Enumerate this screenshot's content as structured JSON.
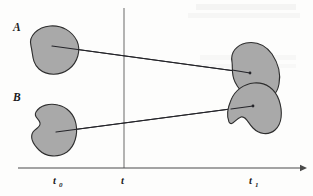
{
  "figure": {
    "title_alt": "Set evolution over time diagram",
    "background_color": "#fdfdfc",
    "blob_fill": "#a9a9a9",
    "blob_stroke": "#2e2e2e",
    "line_color": "#25252a",
    "axis_color": "#4a4a4a",
    "set_labels": [
      {
        "name": "label-A",
        "text": "A",
        "x": 13,
        "y": 31
      },
      {
        "name": "label-B",
        "text": "B",
        "x": 13,
        "y": 101
      }
    ],
    "axis": {
      "name": "time-axis",
      "y": 168,
      "x_start": 18,
      "x_end": 303,
      "ticks": [
        {
          "name": "tick-t0",
          "base": "t",
          "sub": "0",
          "x": 57
        },
        {
          "name": "tick-t",
          "base": "t",
          "sub": "",
          "x": 124
        },
        {
          "name": "tick-t1",
          "base": "t",
          "sub": "1",
          "x": 253
        }
      ],
      "label_y": 184
    },
    "vertical_line": {
      "name": "current-time-line",
      "x": 124,
      "y_top": 8,
      "y_bottom": 168
    },
    "blobs": [
      {
        "name": "blob-A-initial",
        "path": "M 31 46 C 28 36, 38 27, 50 26 C 62 25, 72 31, 77 41 C 81 50, 78 62, 69 69 C 60 76, 47 76, 39 69 C 32 63, 33 54, 31 46 Z",
        "center": [
          52,
          46
        ]
      },
      {
        "name": "blob-B-initial",
        "path": "M 36 112 C 40 105, 50 103, 58 105 C 67 107, 74 114, 76 124 C 78 134, 75 146, 67 152 C 58 158, 46 157, 39 150 C 33 144, 30 137, 33 132 C 36 128, 41 127, 40 123 C 39 118, 33 117, 36 112 Z",
        "center": [
          56,
          132
        ]
      },
      {
        "name": "blob-A-final",
        "path": "M 232 62 C 230 52, 237 45, 246 43 C 257 41, 266 46, 272 54 C 278 63, 281 74, 279 84 C 277 95, 270 101, 260 100 C 249 99, 240 92, 235 82 C 231 74, 233 68, 232 62 Z",
        "center": [
          250,
          73
        ]
      },
      {
        "name": "blob-B-final",
        "path": "M 231 100 C 235 90, 244 84, 254 83 C 266 82, 275 89, 279 100 C 283 112, 282 124, 275 130 C 268 136, 259 134, 253 128 C 248 123, 246 116, 241 117 C 235 119, 232 127, 229 122 C 226 115, 228 107, 231 100 Z",
        "center": [
          253,
          106
        ]
      }
    ],
    "motion_lines": [
      {
        "name": "motion-line-A",
        "x1": 52,
        "y1": 46,
        "x2": 250,
        "y2": 73
      },
      {
        "name": "motion-line-B",
        "x1": 56,
        "y1": 132,
        "x2": 253,
        "y2": 106
      }
    ]
  }
}
